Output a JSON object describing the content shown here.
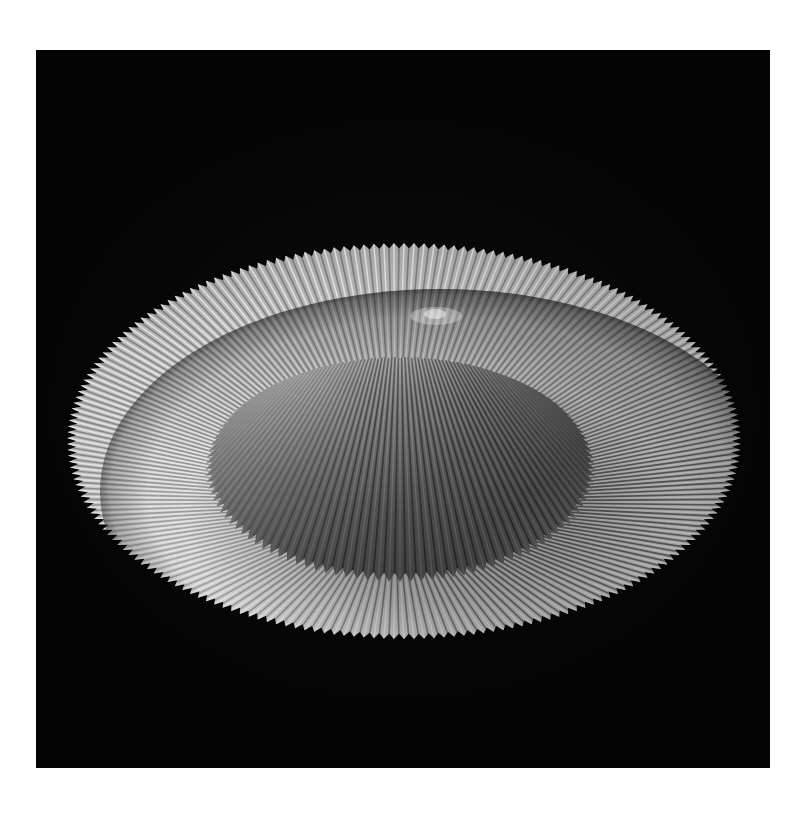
{
  "page": {
    "background_color": "#ffffff",
    "border_top": 50,
    "border_left": 36,
    "border_right": 34,
    "border_bottom": 50
  },
  "photo": {
    "name": "pleated-conical-form-photograph",
    "medium": "black-and-white photograph",
    "background_color": "#040404",
    "frame": {
      "x": 36,
      "y": 50,
      "width": 734,
      "height": 718
    },
    "alt_text": "Monochrome studio photograph of a pleated conical paper form with a wide circular pleated brim, lit from the upper left on a black background."
  },
  "subject": {
    "name": "pleated-conical-form",
    "description": "Accordion-pleated paper or fabric cone with a broad radiating brim, resembling a wide-brimmed conical hat or a collapsed lampshade.",
    "apex": {
      "x": 400,
      "y": 262
    },
    "crown": {
      "name": "pleated-crown",
      "base_center": {
        "x": 400,
        "y": 470
      },
      "base_radius_x": 195,
      "base_radius_y": 112,
      "height": 208,
      "pleat_count": 112,
      "highlight_side": "upper-left",
      "shadow_side": "lower-right"
    },
    "brim": {
      "name": "pleated-brim",
      "center": {
        "x": 404,
        "y": 441
      },
      "radius_x": 337,
      "radius_y": 198,
      "pleat_count": 210,
      "edge_style": "sawtooth",
      "tooth_depth_px": 9,
      "front_edge_y": 640,
      "back_edge_y": 243,
      "left_edge_x": 67,
      "right_edge_x": 741
    }
  },
  "lighting": {
    "key_light_direction": "upper-left",
    "fill": "low",
    "contrast": "high"
  },
  "tones": {
    "background_black": "#040404",
    "deep_shadow": "#1a1a1a",
    "mid_shadow": "#4a4a4a",
    "mid_gray": "#7c7c7c",
    "light_gray": "#b4b4b4",
    "highlight": "#dcdcdc",
    "specular_white": "#f2f2f2"
  }
}
